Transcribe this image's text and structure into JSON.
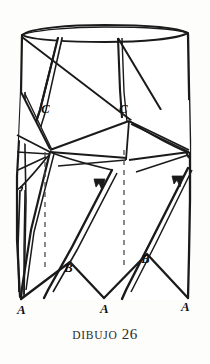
{
  "figure": {
    "caption_word": "DIBUJO",
    "caption_number": "26",
    "ink_color": "#1a1a1a",
    "paper_color": "#fdfdfb",
    "fill_color": "#ffffff",
    "labels": [
      {
        "text": "C",
        "x": 41,
        "y": 113
      },
      {
        "text": "C",
        "x": 119,
        "y": 113
      },
      {
        "text": "B",
        "x": 64,
        "y": 272
      },
      {
        "text": "B",
        "x": 141,
        "y": 263
      },
      {
        "text": "A",
        "x": 21,
        "y": 312
      },
      {
        "text": "A",
        "x": 104,
        "y": 310
      },
      {
        "text": "A",
        "x": 185,
        "y": 308
      }
    ],
    "dashed_lines": [
      {
        "x": 45,
        "y1": 152,
        "y2": 268
      },
      {
        "x": 124,
        "y1": 148,
        "y2": 268
      }
    ],
    "arrow_marks": [
      {
        "x": 99,
        "y": 184
      },
      {
        "x": 177,
        "y": 181
      }
    ],
    "figure_type": "folded-pleat-cylinder-line-drawing"
  }
}
